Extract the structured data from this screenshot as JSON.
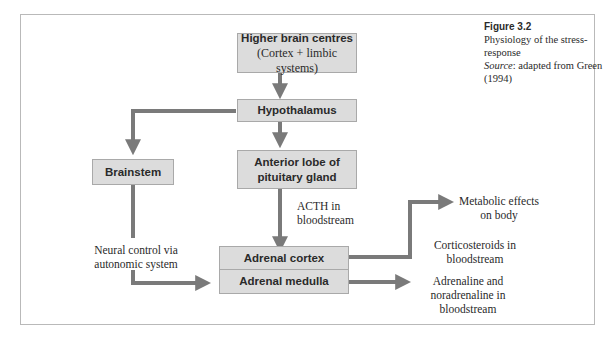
{
  "figure": {
    "number": "Figure 3.2",
    "title": "Physiology of the stress-response",
    "source_label": "Source",
    "source_text": ": adapted from Green (1994)"
  },
  "boxes": {
    "higher_brain": {
      "title": "Higher brain centres",
      "subtitle": "(Cortex + limbic systems)"
    },
    "hypothalamus": {
      "title": "Hypothalamus"
    },
    "brainstem": {
      "title": "Brainstem"
    },
    "anterior_pituitary": {
      "line1": "Anterior lobe of",
      "line2": "pituitary gland"
    },
    "adrenal_cortex": {
      "title": "Adrenal cortex"
    },
    "adrenal_medulla": {
      "title": "Adrenal medulla"
    }
  },
  "labels": {
    "acth": {
      "line1": "ACTH in",
      "line2": "bloodstream"
    },
    "neural": {
      "line1": "Neural control via",
      "line2": "autonomic system"
    },
    "metabolic": {
      "line1": "Metabolic effects",
      "line2": "on body"
    },
    "corticosteroids": {
      "line1": "Corticosteroids in",
      "line2": "bloodstream"
    },
    "adrenaline": {
      "line1": "Adrenaline and",
      "line2": "noradrenaline in",
      "line3": "bloodstream"
    }
  },
  "colors": {
    "box_fill": "#dcdcdc",
    "box_border": "#a9a9a9",
    "arrow": "#7a7a7a",
    "frame": "#b9b9b9"
  }
}
